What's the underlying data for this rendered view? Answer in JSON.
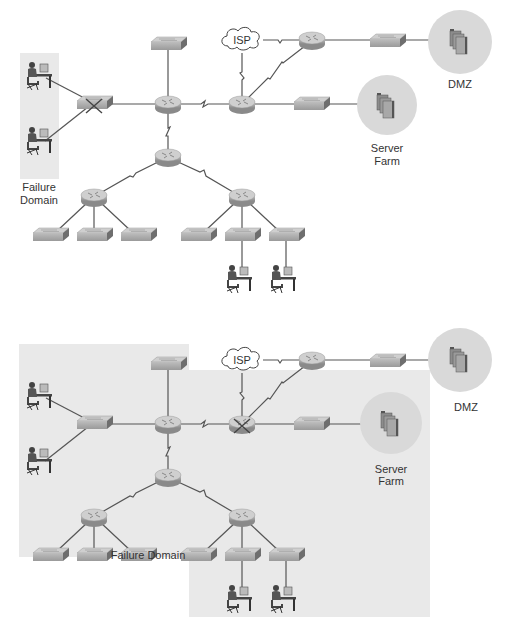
{
  "colors": {
    "shade": "#e9e9e9",
    "circle": "#d9d9d9",
    "line": "#555555",
    "device": "#a8a8a8",
    "device_dark": "#6e6e6e",
    "text": "#333333"
  },
  "diagrams": [
    {
      "name": "switch-failure",
      "labels": {
        "isp": "ISP",
        "dmz": "DMZ",
        "server_farm_1": "Server",
        "server_farm_2": "Farm",
        "failure_domain_1": "Failure",
        "failure_domain_2": "Domain"
      },
      "failed_device": "access-switch-left"
    },
    {
      "name": "router-failure",
      "labels": {
        "isp": "ISP",
        "dmz": "DMZ",
        "server_farm_1": "Server",
        "server_farm_2": "Farm",
        "failure_domain": "Failure Domain"
      },
      "failed_device": "core-router-right"
    }
  ]
}
